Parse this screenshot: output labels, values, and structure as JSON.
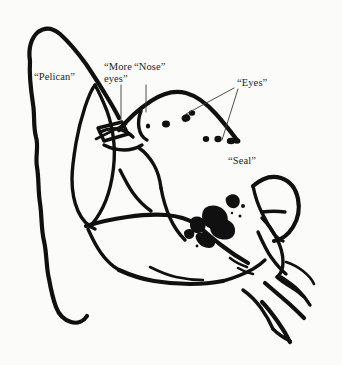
{
  "figure": {
    "background_color": "#fbfbf9",
    "ink_color": "#101010",
    "label_color": "#252525",
    "leader_color": "#3a3a3a",
    "width": 342,
    "height": 365
  },
  "labels": [
    {
      "id": "pelican",
      "text": "“Pelican”",
      "x": 34,
      "y": 71
    },
    {
      "id": "more-eyes",
      "text": "“More\neyes”",
      "x": 104,
      "y": 61
    },
    {
      "id": "nose",
      "text": "“Nose”",
      "x": 134,
      "y": 61
    },
    {
      "id": "eyes",
      "text": "“Eyes”",
      "x": 237,
      "y": 77
    },
    {
      "id": "seal",
      "text": "“Seal”",
      "x": 228,
      "y": 155
    }
  ],
  "annotations": {
    "leaders": [
      {
        "id": "leader-more-eyes",
        "from_label": "more-eyes",
        "d": "M 121 85 L 121 122"
      },
      {
        "id": "leader-nose",
        "from_label": "nose",
        "d": "M 146 85 L 146 112"
      },
      {
        "id": "leader-eyes-upper",
        "from_label": "eyes",
        "d": "M 234 88 L 186 114"
      },
      {
        "id": "leader-eyes-lower",
        "from_label": "eyes",
        "d": "M 238 89 L 222 140"
      }
    ]
  },
  "strokes": {
    "pelican_outline": "M 30 61 C 28 49 31 38 38 32 C 46 26 54 29 60 34 C 70 43 78 53 86 64 C 94 76 101 87 107 97 C 112 105 116 112 119 118",
    "pelican_left_edge": "M 30 61 C 29 76 31 91 33 104 C 35 116 33 126 36 137 C 39 147 35 156 37 167 C 39 179 38 191 40 203 C 42 216 41 229 44 241 C 47 254 46 267 49 279 C 51 290 53 299 56 307 C 59 315 64 320 71 322 C 78 324 84 321 87 316",
    "pelican_beak_inner": "M 95 85 C 91 90 88 98 85 107 C 81 119 78 131 76 143 C 74 155 72 167 72 179 C 72 191 74 202 78 211 C 82 220 88 226 95 229",
    "pelican_beak_outer": "M 95 85 C 99 92 103 101 107 111 C 111 122 113 133 114 144 C 115 156 114 167 112 178 C 110 189 107 199 103 207 C 99 215 95 221 91 225",
    "seal_head_top": "M 119 130 C 128 119 139 109 151 101 C 163 93 175 90 186 93 C 197 96 207 104 216 114 C 224 123 231 132 237 140",
    "seal_snout": "M 100 132 C 106 129 112 128 118 129 C 124 130 129 133 133 137",
    "seal_snout_lower": "M 104 145 C 110 148 117 150 124 150 C 131 150 137 148 142 145",
    "seal_beak_box": "M 98 128 L 122 122 L 128 134 L 104 141 Z",
    "seal_beak_slash": "M 96 139 L 126 124",
    "seal_nose_mark": "M 141 111 C 139 116 138 122 139 128 C 140 134 143 138 147 140",
    "seal_jaw": "M 139 148 C 145 152 150 158 154 165 C 158 172 160 180 161 188",
    "seal_neck": "M 161 188 C 163 199 166 209 170 218 C 174 227 179 234 185 240",
    "seal_chest": "M 120 170 C 124 178 128 186 133 193 C 138 200 144 206 151 211",
    "seal_belly_top": "M 86 226 C 99 222 113 219 127 217 C 141 215 154 214 166 215 C 178 216 188 219 196 224",
    "seal_belly_lower": "M 88 229 C 92 238 96 246 101 253 C 106 260 112 266 119 270",
    "seal_body_curve": "M 196 224 C 204 231 212 238 221 245 C 230 252 239 258 248 263",
    "seal_lower_body": "M 119 270 C 130 275 142 279 154 281 C 166 283 178 284 190 284 C 202 284 213 283 223 281",
    "seal_bottom_edge": "M 223 281 C 234 278 244 274 253 269 C 258 266 262 263 265 260",
    "seal_tail_ridge": "M 150 267 C 158 271 167 275 176 277 C 185 279 194 280 203 280",
    "flipper_upper_outer": "M 253 186 C 262 178 272 175 281 178 C 290 181 296 189 298 199 C 300 209 298 219 293 227 C 288 235 281 240 274 241",
    "flipper_upper_inner": "M 253 186 C 255 196 258 205 262 213 C 266 221 270 228 274 234 C 277 238 280 240 283 241",
    "flipper_upper_vein": "M 262 212 C 270 211 278 211 285 212",
    "flipper_lower_outer": "M 262 218 C 268 224 273 231 277 239 C 281 247 283 255 283 262 C 283 269 281 274 277 277",
    "flipper_lower_inner": "M 258 232 C 262 241 266 250 271 257 C 276 264 281 270 286 274",
    "flipper_tip": "M 277 277 C 281 281 286 284 291 287 C 296 290 300 293 303 296",
    "tail_fan_upper": "M 286 262 C 292 264 298 267 303 271 C 308 275 312 279 314 284",
    "tail_fan_mid": "M 281 277 C 287 281 293 285 298 290 C 303 295 307 300 310 305",
    "tail_fan_lower": "M 265 283 C 272 289 279 295 286 301 C 293 307 299 313 304 318",
    "hind_flipper": "M 243 290 C 250 295 256 301 261 308 C 266 315 270 322 273 329",
    "hind_flipper_2": "M 262 302 C 268 308 273 315 278 322 C 283 329 287 336 290 342",
    "small_hook_a": "M 238 268 C 243 271 248 273 253 274",
    "small_hook_b": "M 230 258 C 235 262 241 265 247 267",
    "tail_end": "M 273 329 C 278 334 284 338 290 341"
  },
  "spots": [
    {
      "id": "spot-upper-1",
      "cx": 186,
      "cy": 118,
      "rx": 4.4,
      "ry": 3.8,
      "rot": -20
    },
    {
      "id": "spot-upper-2",
      "cx": 192,
      "cy": 113,
      "rx": 3.2,
      "ry": 2.8,
      "rot": 10
    },
    {
      "id": "spot-mid-1",
      "cx": 166,
      "cy": 124,
      "rx": 4.0,
      "ry": 3.4,
      "rot": 0
    },
    {
      "id": "spot-mid-2",
      "cx": 148,
      "cy": 126,
      "rx": 2.2,
      "ry": 2.6,
      "rot": 0
    },
    {
      "id": "spot-row-1",
      "cx": 206,
      "cy": 139,
      "rx": 3.2,
      "ry": 3.0,
      "rot": 0
    },
    {
      "id": "spot-row-2",
      "cx": 218,
      "cy": 139,
      "rx": 3.6,
      "ry": 3.2,
      "rot": 0
    },
    {
      "id": "spot-row-3",
      "cx": 231,
      "cy": 141,
      "rx": 4.2,
      "ry": 3.2,
      "rot": 0
    },
    {
      "id": "spot-row-4",
      "cx": 237,
      "cy": 141,
      "rx": 3.4,
      "ry": 2.8,
      "rot": 0
    }
  ],
  "blot_cluster": {
    "id": "body-ink-blot",
    "paths": [
      "M 228 196 C 232 193 237 194 239 198 C 241 202 239 207 235 208 C 231 209 227 206 226 202 C 225 199 226 197 228 196 Z",
      "M 205 208 C 211 204 219 205 224 210 C 229 215 229 223 224 227 C 218 231 210 230 205 225 C 201 221 201 212 205 208 Z",
      "M 214 220 C 221 217 229 219 233 224 C 237 230 235 237 229 239 C 222 241 214 238 211 232 C 209 227 210 222 214 220 Z",
      "M 192 218 C 197 215 203 217 205 222 C 207 227 204 232 199 233 C 194 234 190 230 190 225 C 190 222 190 220 192 218 Z",
      "M 198 233 C 204 231 211 233 214 238 C 217 243 214 248 209 248 C 203 248 198 244 196 239 C 195 236 196 234 198 233 Z",
      "M 186 230 C 189 228 193 229 194 232 C 195 236 193 239 189 239 C 186 239 184 236 184 233 C 184 231 185 231 186 230 Z"
    ],
    "dots": [
      {
        "cx": 243,
        "cy": 206,
        "r": 2.0
      },
      {
        "cx": 240,
        "cy": 216,
        "r": 1.5
      },
      {
        "cx": 232,
        "cy": 213,
        "r": 1.2
      },
      {
        "cx": 222,
        "cy": 234,
        "r": 1.3
      },
      {
        "cx": 208,
        "cy": 241,
        "r": 1.1
      },
      {
        "cx": 197,
        "cy": 246,
        "r": 1.4
      }
    ]
  }
}
